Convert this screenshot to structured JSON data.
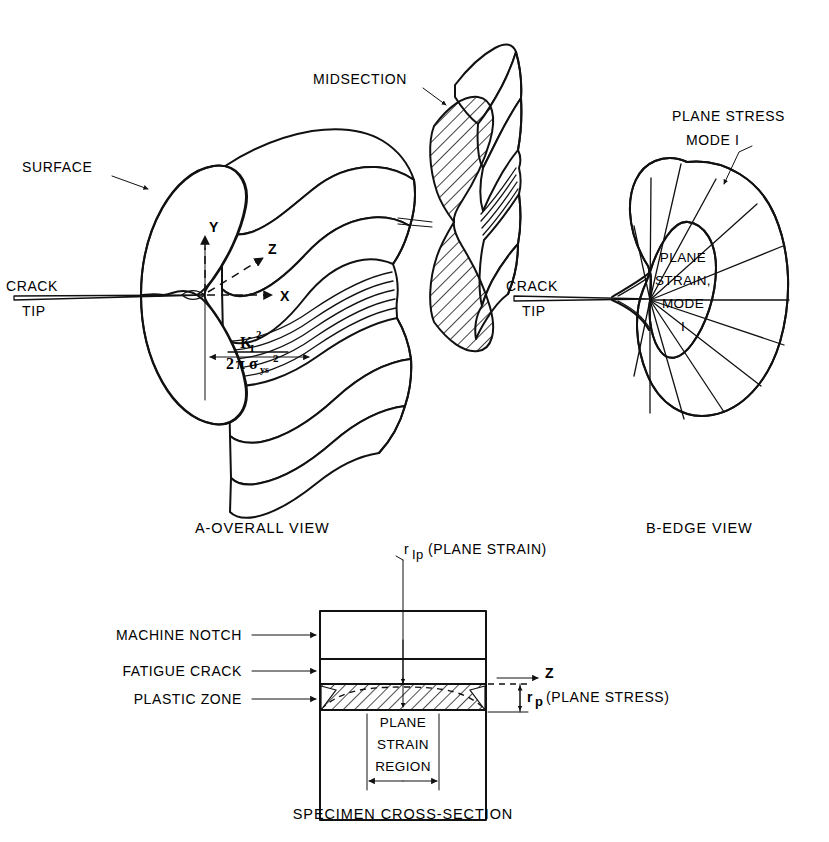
{
  "figure": {
    "ink_color": "#111111",
    "background": "#ffffff"
  },
  "panel_a": {
    "caption": "A-OVERALL VIEW",
    "labels": {
      "surface": "SURFACE",
      "midsection": "MIDSECTION",
      "crack_line1": "CRACK",
      "crack_line2": "TIP"
    },
    "axes": {
      "y": "Y",
      "x": "X",
      "z": "Z"
    },
    "formula": {
      "numerator_base": "K",
      "numerator_sub": "I",
      "numerator_sup": "2",
      "denominator_lead": "2",
      "denominator_pi": "π",
      "denominator_sigma": "σ",
      "denominator_sub": "ys",
      "denominator_sup": "2",
      "plain": "K_I^2 / (2πσ_ys^2)"
    }
  },
  "panel_b": {
    "caption": "B-EDGE VIEW",
    "labels": {
      "plane_stress_line1": "PLANE STRESS",
      "plane_stress_line2": "MODE I",
      "plane_strain_line1": "PLANE",
      "plane_strain_line2": "STRAIN,",
      "plane_strain_line3": "MODE",
      "plane_strain_line4": "I",
      "crack_line1": "CRACK",
      "crack_line2": "TIP"
    }
  },
  "panel_c": {
    "caption": "SPECIMEN CROSS-SECTION",
    "labels": {
      "machine_notch": "MACHINE NOTCH",
      "fatigue_crack": "FATIGUE CRACK",
      "plastic_zone": "PLASTIC ZONE",
      "plane_strain_region_line1": "PLANE",
      "plane_strain_region_line2": "STRAIN",
      "plane_strain_region_line3": "REGION",
      "z_axis": "Z"
    },
    "dimensions": {
      "r_plane_strain_symbol": "r",
      "r_plane_strain_sub": "Ip",
      "r_plane_strain_note": "(PLANE STRAIN)",
      "r_plane_stress_symbol": "r",
      "r_plane_stress_sub": "p",
      "r_plane_stress_note": "(PLANE STRESS)"
    }
  }
}
